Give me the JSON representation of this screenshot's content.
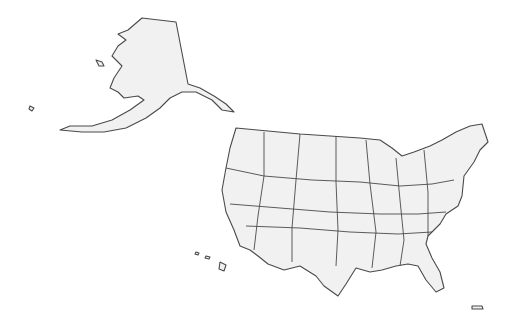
{
  "map": {
    "title": "",
    "type": "blank-choropleth",
    "fill_color": "#f1f1f1",
    "stroke_color": "#4a4a4a",
    "background": "#ffffff",
    "regions": [
      {
        "id": "AK",
        "name": "Alaska"
      },
      {
        "id": "HI",
        "name": "Hawaii"
      },
      {
        "id": "PR",
        "name": "Puerto Rico"
      },
      {
        "id": "CONUS",
        "name": "Contiguous United States"
      }
    ]
  }
}
